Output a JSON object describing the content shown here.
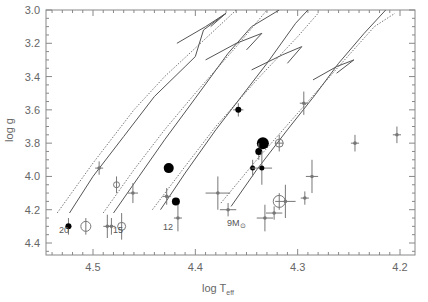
{
  "chart_data": {
    "type": "scatter",
    "title": "",
    "xlabel": "log T_eff",
    "ylabel": "log g",
    "xlim": [
      4.545,
      4.195
    ],
    "ylim": [
      4.5,
      3.0
    ],
    "x_reversed": true,
    "y_reversed": true,
    "grid": false,
    "legend": null,
    "x_ticks": [
      "4.5",
      "4.4",
      "4.3",
      "4.2"
    ],
    "y_ticks": [
      "3.0",
      "3.2",
      "3.4",
      "3.6",
      "3.8",
      "4.0",
      "4.2",
      "4.4"
    ],
    "annotations": [
      {
        "text": "20",
        "x": 4.523,
        "y": 4.25
      },
      {
        "text": "15",
        "x": 4.482,
        "y": 4.25
      },
      {
        "text": "12",
        "x": 4.434,
        "y": 4.22
      },
      {
        "text": "9M⊙",
        "x": 4.365,
        "y": 4.19
      }
    ],
    "series": [
      {
        "name": "evolutionary tracks (solid)",
        "style": "solid",
        "tracks": [
          {
            "mass": "20",
            "points": [
              [
                4.523,
                4.22
              ],
              [
                4.5,
                4.0
              ],
              [
                4.47,
                3.76
              ],
              [
                4.44,
                3.52
              ],
              [
                4.41,
                3.34
              ],
              [
                4.4,
                3.28
              ],
              [
                4.392,
                3.12
              ],
              [
                4.37,
                3.02
              ]
            ]
          },
          {
            "mass": "15",
            "points": [
              [
                4.48,
                4.22
              ],
              [
                4.455,
                4.0
              ],
              [
                4.43,
                3.78
              ],
              [
                4.4,
                3.53
              ],
              [
                4.368,
                3.26
              ],
              [
                4.345,
                3.1
              ],
              [
                4.318,
                3.0
              ]
            ]
          },
          {
            "mass": "12",
            "points": [
              [
                4.434,
                4.2
              ],
              [
                4.41,
                3.98
              ],
              [
                4.38,
                3.72
              ],
              [
                4.355,
                3.52
              ],
              [
                4.33,
                3.32
              ],
              [
                4.302,
                3.08
              ],
              [
                4.29,
                3.0
              ]
            ]
          },
          {
            "mass": "9",
            "points": [
              [
                4.365,
                4.18
              ],
              [
                4.34,
                3.96
              ],
              [
                4.31,
                3.72
              ],
              [
                4.283,
                3.51
              ],
              [
                4.26,
                3.32
              ],
              [
                4.235,
                3.14
              ],
              [
                4.214,
                3.0
              ]
            ]
          }
        ]
      },
      {
        "name": "blue-loop hooks",
        "style": "solid",
        "tracks": [
          {
            "points": [
              [
                4.418,
                3.2
              ],
              [
                4.39,
                3.1
              ],
              [
                4.37,
                3.02
              ],
              [
                4.385,
                3.1
              ]
            ]
          },
          {
            "points": [
              [
                4.39,
                3.3
              ],
              [
                4.36,
                3.2
              ],
              [
                4.335,
                3.14
              ],
              [
                4.35,
                3.24
              ]
            ]
          },
          {
            "points": [
              [
                4.345,
                3.36
              ],
              [
                4.315,
                3.27
              ],
              [
                4.296,
                3.22
              ],
              [
                4.31,
                3.32
              ]
            ]
          },
          {
            "points": [
              [
                4.285,
                3.42
              ],
              [
                4.262,
                3.34
              ],
              [
                4.245,
                3.3
              ],
              [
                4.262,
                3.38
              ]
            ]
          }
        ]
      },
      {
        "name": "evolutionary tracks (dotted)",
        "style": "dotted",
        "tracks": [
          {
            "points": [
              [
                4.535,
                4.22
              ],
              [
                4.5,
                3.92
              ],
              [
                4.46,
                3.6
              ],
              [
                4.43,
                3.4
              ],
              [
                4.36,
                3.0
              ]
            ]
          },
          {
            "points": [
              [
                4.49,
                4.22
              ],
              [
                4.46,
                3.96
              ],
              [
                4.43,
                3.72
              ],
              [
                4.4,
                3.5
              ],
              [
                4.36,
                3.22
              ],
              [
                4.33,
                3.0
              ]
            ]
          },
          {
            "points": [
              [
                4.442,
                4.2
              ],
              [
                4.41,
                3.94
              ],
              [
                4.38,
                3.7
              ],
              [
                4.34,
                3.42
              ],
              [
                4.3,
                3.16
              ],
              [
                4.28,
                3.02
              ]
            ]
          },
          {
            "points": [
              [
                4.375,
                4.16
              ],
              [
                4.34,
                3.9
              ],
              [
                4.3,
                3.62
              ],
              [
                4.26,
                3.34
              ],
              [
                4.225,
                3.1
              ],
              [
                4.205,
                3.02
              ]
            ]
          }
        ]
      },
      {
        "name": "observed stars (filled)",
        "marker": "filled-circle",
        "points": [
          {
            "x": 4.524,
            "y": 4.3,
            "size": 3,
            "xerr": 0.003,
            "yerr": 0.05
          },
          {
            "x": 4.426,
            "y": 3.95,
            "size": 5,
            "xerr": 0.0,
            "yerr": 0.0
          },
          {
            "x": 4.419,
            "y": 4.15,
            "size": 4,
            "xerr": 0.0,
            "yerr": 0.0
          },
          {
            "x": 4.358,
            "y": 3.6,
            "size": 3,
            "xerr": 0.005,
            "yerr": 0.04
          },
          {
            "x": 4.334,
            "y": 3.8,
            "size": 6,
            "xerr": 0.0,
            "yerr": 0.0
          },
          {
            "x": 4.338,
            "y": 3.85,
            "size": 3.5,
            "xerr": 0.0,
            "yerr": 0.05
          },
          {
            "x": 4.344,
            "y": 3.95,
            "size": 2.5,
            "xerr": 0.0,
            "yerr": 0.05
          },
          {
            "x": 4.335,
            "y": 3.95,
            "size": 2.5,
            "xerr": 0.01,
            "yerr": 0.1
          }
        ]
      },
      {
        "name": "observed stars (open)",
        "marker": "open-circle",
        "points": [
          {
            "x": 4.507,
            "y": 4.3,
            "size": 5,
            "xerr": 0.0,
            "yerr": 0.05
          },
          {
            "x": 4.477,
            "y": 4.05,
            "size": 3,
            "xerr": 0.0,
            "yerr": 0.05
          },
          {
            "x": 4.472,
            "y": 4.3,
            "size": 4,
            "xerr": 0.0,
            "yerr": 0.08
          },
          {
            "x": 4.318,
            "y": 3.8,
            "size": 4,
            "xerr": 0.004,
            "yerr": 0.05
          },
          {
            "x": 4.318,
            "y": 4.15,
            "size": 6,
            "xerr": 0.0,
            "yerr": 0.05
          }
        ]
      },
      {
        "name": "observed stars (crosses)",
        "marker": "small-cross",
        "points": [
          {
            "x": 4.494,
            "y": 3.95,
            "xerr": 0.0,
            "yerr": 0.04
          },
          {
            "x": 4.486,
            "y": 4.3,
            "xerr": 0.0,
            "yerr": 0.07
          },
          {
            "x": 4.482,
            "y": 4.3,
            "xerr": 0.0,
            "yerr": 0.05
          },
          {
            "x": 4.461,
            "y": 4.1,
            "xerr": 0.005,
            "yerr": 0.06
          },
          {
            "x": 4.428,
            "y": 4.12,
            "xerr": 0.004,
            "yerr": 0.05
          },
          {
            "x": 4.417,
            "y": 4.25,
            "xerr": 0.0,
            "yerr": 0.08
          },
          {
            "x": 4.378,
            "y": 4.1,
            "xerr": 0.012,
            "yerr": 0.1
          },
          {
            "x": 4.368,
            "y": 4.2,
            "xerr": 0.008,
            "yerr": 0.04
          },
          {
            "x": 4.332,
            "y": 4.25,
            "xerr": 0.008,
            "yerr": 0.08
          },
          {
            "x": 4.323,
            "y": 4.22,
            "xerr": 0.008,
            "yerr": 0.04
          },
          {
            "x": 4.312,
            "y": 4.15,
            "xerr": 0.01,
            "yerr": 0.1
          },
          {
            "x": 4.293,
            "y": 4.13,
            "xerr": 0.004,
            "yerr": 0.04
          },
          {
            "x": 4.286,
            "y": 4.0,
            "xerr": 0.006,
            "yerr": 0.1
          },
          {
            "x": 4.294,
            "y": 3.56,
            "xerr": 0.0,
            "yerr": 0.07
          },
          {
            "x": 4.244,
            "y": 3.8,
            "xerr": 0.004,
            "yerr": 0.05
          },
          {
            "x": 4.203,
            "y": 3.75,
            "xerr": 0.004,
            "yerr": 0.05
          }
        ]
      }
    ]
  },
  "axes": {
    "xlabel_main": "log T",
    "xlabel_sub": "eff",
    "ylabel": "log g",
    "x_ticks": [
      "4.5",
      "4.4",
      "4.3",
      "4.2"
    ],
    "y_ticks": [
      "3.0",
      "3.2",
      "3.4",
      "3.6",
      "3.8",
      "4.0",
      "4.2",
      "4.4"
    ]
  },
  "labels": {
    "m20": "20",
    "m15": "15",
    "m12": "12",
    "m9": "9M",
    "sun": "⊙"
  },
  "colors": {
    "frame": "#888888",
    "text": "#666666",
    "track": "#555555",
    "filled": "#000000",
    "cross": "#777777"
  }
}
